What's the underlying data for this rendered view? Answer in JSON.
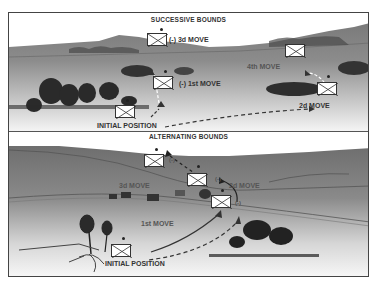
{
  "diagram": {
    "top_panel": {
      "title": "SUCCESSIVE BOUNDS",
      "labels": {
        "third_move": "(-) 3d MOVE",
        "first_move": "(-) 1st MOVE",
        "fourth_move": "4th MOVE",
        "second_move": "2d MOVE",
        "initial_position": "INITIAL POSITION"
      }
    },
    "bottom_panel": {
      "title": "ALTERNATING BOUNDS",
      "labels": {
        "third_move": "3d MOVE",
        "second_move": "2d MOVE",
        "first_move": "1st MOVE",
        "initial_position": "INITIAL POSITION",
        "minus_a": "(-)",
        "minus_b": "(-)",
        "minus_c": "(-)"
      }
    },
    "colors": {
      "terrain_dark": "#6a6a6a",
      "terrain_light": "#e8e8e8",
      "ink": "#333333",
      "unit_fill": "#ffffff"
    }
  }
}
